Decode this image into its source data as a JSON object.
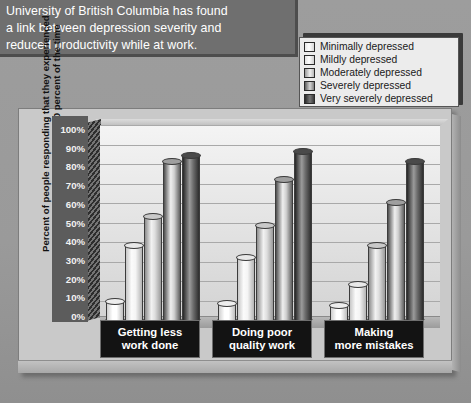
{
  "caption": {
    "lines": [
      "University of British Columbia has found",
      "a link between depression severity and",
      "reduced productivity while at work."
    ]
  },
  "legend": {
    "items": [
      {
        "label": "Minimally depressed",
        "color": "#ffffff"
      },
      {
        "label": "Mildly depressed",
        "color": "#f2f2f2"
      },
      {
        "label": "Moderately depressed",
        "color": "#c6c6c6"
      },
      {
        "label": "Severely depressed",
        "color": "#8e8e8e"
      },
      {
        "label": "Very severely depressed",
        "color": "#454545"
      }
    ]
  },
  "axis": {
    "y_title_line1": "Percent of people responding that they experienced",
    "y_title_line2": "productivity issues at least 50 percent of the time",
    "y_ticks": [
      "100%",
      "90%",
      "80%",
      "70%",
      "60%",
      "50%",
      "40%",
      "30%",
      "20%",
      "10%",
      "0%"
    ]
  },
  "chart_data": {
    "type": "bar",
    "title": "",
    "xlabel": "",
    "ylabel": "Percent of people responding that they experienced productivity issues at least 50 percent of the time",
    "ylim": [
      0,
      100
    ],
    "ytick_values": [
      0,
      10,
      20,
      30,
      40,
      50,
      60,
      70,
      80,
      90,
      100
    ],
    "grid": true,
    "legend_position": "top-right",
    "categories": [
      "Getting less work done",
      "Doing poor quality work",
      "Making more mistakes"
    ],
    "series": [
      {
        "name": "Minimally depressed",
        "color": "#ffffff",
        "values": [
          9,
          8,
          7
        ]
      },
      {
        "name": "Mildly depressed",
        "color": "#f2f2f2",
        "values": [
          38,
          32,
          18
        ]
      },
      {
        "name": "Moderately depressed",
        "color": "#c6c6c6",
        "values": [
          53,
          48,
          38
        ]
      },
      {
        "name": "Severely depressed",
        "color": "#8e8e8e",
        "values": [
          81,
          72,
          60
        ]
      },
      {
        "name": "Very severely depressed",
        "color": "#454545",
        "values": [
          84,
          86,
          81
        ]
      }
    ]
  }
}
